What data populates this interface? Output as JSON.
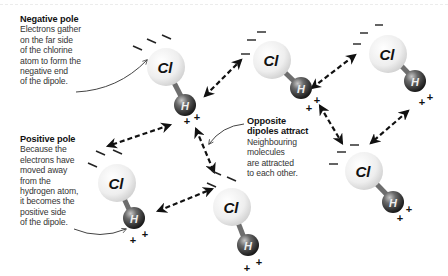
{
  "annotations": {
    "negative_pole": {
      "title": "Negative pole",
      "body": "Electrons gather\non the far side\nof the chlorine\natom to form the\nnegative end\nof the dipole."
    },
    "positive_pole": {
      "title": "Positive pole",
      "body": "Because the\nelectrons have\nmoved away\nfrom the\nhydrogen atom,\nit becomes the\npositive side\nof the dipole."
    },
    "opposite_dipoles": {
      "title_line1": "Opposite",
      "title_line2": "dipoles attract",
      "body": "Neighbouring\nmolecules\nare attracted\nto each other."
    }
  },
  "molecules": [
    {
      "id": "m1",
      "cl_label": "Cl",
      "h_label": "H"
    },
    {
      "id": "m2",
      "cl_label": "Cl",
      "h_label": "H"
    },
    {
      "id": "m3",
      "cl_label": "Cl",
      "h_label": "H"
    },
    {
      "id": "m4",
      "cl_label": "Cl",
      "h_label": "H"
    },
    {
      "id": "m5",
      "cl_label": "Cl",
      "h_label": "H"
    },
    {
      "id": "m6",
      "cl_label": "Cl",
      "h_label": "H"
    }
  ],
  "symbols": {
    "negative": "–",
    "positive": "+"
  },
  "colors": {
    "chlorine": "#f2f2f2",
    "hydrogen": "#2a2a2a",
    "bond": "#6e6e6e",
    "arrow": "#111111",
    "annotation_line": "#555555"
  }
}
